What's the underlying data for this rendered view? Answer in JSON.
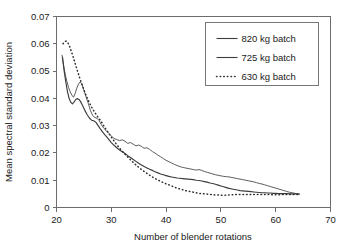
{
  "chart_data": {
    "type": "line",
    "title": "",
    "xlabel": "Number of blender rotations",
    "ylabel": "Mean spectral standard deviation",
    "xlim": [
      20,
      70
    ],
    "ylim": [
      0,
      0.07
    ],
    "xticks": [
      20,
      30,
      40,
      50,
      60,
      70
    ],
    "xtick_labels": [
      "20",
      "30",
      "40",
      "50",
      "60",
      "70"
    ],
    "yticks": [
      0,
      0.01,
      0.02,
      0.03,
      0.04,
      0.05,
      0.06,
      0.07
    ],
    "ytick_labels": [
      "0",
      "0.01",
      "0.02",
      "0.03",
      "0.04",
      "0.05",
      "0.06",
      "0.07"
    ],
    "grid": false,
    "legend_position": "upper right",
    "series": [
      {
        "name": "820 kg batch",
        "style": "solid",
        "color": "#4a4a4a",
        "points": [
          [
            21.0,
            0.0558
          ],
          [
            21.3,
            0.052
          ],
          [
            21.6,
            0.0487
          ],
          [
            21.9,
            0.0462
          ],
          [
            22.2,
            0.044
          ],
          [
            22.5,
            0.0424
          ],
          [
            22.8,
            0.0412
          ],
          [
            23.1,
            0.0404
          ],
          [
            23.4,
            0.0418
          ],
          [
            23.7,
            0.0437
          ],
          [
            24.0,
            0.0452
          ],
          [
            24.3,
            0.046
          ],
          [
            24.6,
            0.0455
          ],
          [
            25.0,
            0.043
          ],
          [
            25.4,
            0.0405
          ],
          [
            25.8,
            0.0382
          ],
          [
            26.2,
            0.0355
          ],
          [
            26.6,
            0.0337
          ],
          [
            27.0,
            0.033
          ],
          [
            27.4,
            0.0327
          ],
          [
            27.8,
            0.0318
          ],
          [
            28.2,
            0.0303
          ],
          [
            28.6,
            0.0291
          ],
          [
            29.0,
            0.0283
          ],
          [
            29.5,
            0.0272
          ],
          [
            30.0,
            0.0262
          ],
          [
            30.5,
            0.0253
          ],
          [
            31.0,
            0.0249
          ],
          [
            31.5,
            0.0245
          ],
          [
            32.0,
            0.0248
          ],
          [
            32.5,
            0.0243
          ],
          [
            33.0,
            0.0235
          ],
          [
            33.5,
            0.0238
          ],
          [
            34.0,
            0.0232
          ],
          [
            34.5,
            0.0226
          ],
          [
            35.0,
            0.0229
          ],
          [
            35.5,
            0.0224
          ],
          [
            36.0,
            0.0217
          ],
          [
            36.5,
            0.0219
          ],
          [
            37.0,
            0.0213
          ],
          [
            37.5,
            0.0205
          ],
          [
            38.0,
            0.0199
          ],
          [
            38.5,
            0.0192
          ],
          [
            39.0,
            0.0186
          ],
          [
            39.5,
            0.0179
          ],
          [
            40.0,
            0.0173
          ],
          [
            40.5,
            0.0168
          ],
          [
            41.0,
            0.0163
          ],
          [
            41.5,
            0.0158
          ],
          [
            42.0,
            0.0154
          ],
          [
            42.5,
            0.015
          ],
          [
            43.0,
            0.0147
          ],
          [
            43.5,
            0.0145
          ],
          [
            44.0,
            0.0143
          ],
          [
            44.5,
            0.0141
          ],
          [
            45.0,
            0.0139
          ],
          [
            45.5,
            0.0137
          ],
          [
            46.0,
            0.0139
          ],
          [
            46.5,
            0.0136
          ],
          [
            47.0,
            0.0132
          ],
          [
            47.5,
            0.0129
          ],
          [
            48.0,
            0.0126
          ],
          [
            48.5,
            0.0123
          ],
          [
            49.0,
            0.012
          ],
          [
            49.5,
            0.0118
          ],
          [
            50.0,
            0.0116
          ],
          [
            50.5,
            0.0114
          ],
          [
            51.0,
            0.0113
          ],
          [
            51.5,
            0.0112
          ],
          [
            52.0,
            0.011
          ],
          [
            52.5,
            0.0108
          ],
          [
            53.0,
            0.0106
          ],
          [
            53.5,
            0.0104
          ],
          [
            54.0,
            0.0102
          ],
          [
            54.5,
            0.01
          ],
          [
            55.0,
            0.0098
          ],
          [
            55.5,
            0.0096
          ],
          [
            56.0,
            0.0094
          ],
          [
            56.5,
            0.0091
          ],
          [
            57.0,
            0.0088
          ],
          [
            57.5,
            0.0086
          ],
          [
            58.0,
            0.0083
          ],
          [
            58.5,
            0.008
          ],
          [
            59.0,
            0.0077
          ],
          [
            59.5,
            0.0074
          ],
          [
            60.0,
            0.0071
          ],
          [
            60.5,
            0.0068
          ],
          [
            61.0,
            0.0065
          ],
          [
            61.5,
            0.0062
          ],
          [
            62.0,
            0.0059
          ],
          [
            62.5,
            0.0056
          ],
          [
            63.0,
            0.0054
          ],
          [
            63.5,
            0.0052
          ],
          [
            64.0,
            0.005
          ],
          [
            64.3,
            0.0049
          ]
        ]
      },
      {
        "name": "725 kg batch",
        "style": "solid",
        "color": "#3c3c3c",
        "points": [
          [
            21.1,
            0.055
          ],
          [
            21.4,
            0.05
          ],
          [
            21.7,
            0.046
          ],
          [
            22.0,
            0.0425
          ],
          [
            22.3,
            0.04
          ],
          [
            22.6,
            0.0386
          ],
          [
            22.9,
            0.038
          ],
          [
            23.2,
            0.0386
          ],
          [
            23.5,
            0.0396
          ],
          [
            23.8,
            0.0399
          ],
          [
            24.1,
            0.0396
          ],
          [
            24.4,
            0.0388
          ],
          [
            24.8,
            0.0372
          ],
          [
            25.2,
            0.0355
          ],
          [
            25.6,
            0.034
          ],
          [
            26.0,
            0.0328
          ],
          [
            26.4,
            0.032
          ],
          [
            26.8,
            0.0318
          ],
          [
            27.2,
            0.0312
          ],
          [
            27.6,
            0.03
          ],
          [
            28.0,
            0.0288
          ],
          [
            28.4,
            0.0277
          ],
          [
            28.8,
            0.0267
          ],
          [
            29.2,
            0.0258
          ],
          [
            29.6,
            0.0248
          ],
          [
            30.0,
            0.0238
          ],
          [
            30.5,
            0.0228
          ],
          [
            31.0,
            0.0219
          ],
          [
            31.5,
            0.0211
          ],
          [
            32.0,
            0.0204
          ],
          [
            32.5,
            0.0198
          ],
          [
            33.0,
            0.019
          ],
          [
            33.5,
            0.0183
          ],
          [
            34.0,
            0.0176
          ],
          [
            34.5,
            0.0169
          ],
          [
            35.0,
            0.0162
          ],
          [
            35.5,
            0.0156
          ],
          [
            36.0,
            0.015
          ],
          [
            36.5,
            0.0145
          ],
          [
            37.0,
            0.014
          ],
          [
            37.5,
            0.0136
          ],
          [
            38.0,
            0.0131
          ],
          [
            38.5,
            0.0127
          ],
          [
            39.0,
            0.0123
          ],
          [
            39.5,
            0.012
          ],
          [
            40.0,
            0.0117
          ],
          [
            40.5,
            0.0114
          ],
          [
            41.0,
            0.0112
          ],
          [
            41.5,
            0.011
          ],
          [
            42.0,
            0.0108
          ],
          [
            42.5,
            0.0107
          ],
          [
            43.0,
            0.0106
          ],
          [
            43.5,
            0.0105
          ],
          [
            44.0,
            0.0104
          ],
          [
            44.5,
            0.0103
          ],
          [
            45.0,
            0.0102
          ],
          [
            45.5,
            0.01
          ],
          [
            46.0,
            0.0099
          ],
          [
            46.5,
            0.0097
          ],
          [
            47.0,
            0.0095
          ],
          [
            47.5,
            0.0093
          ],
          [
            48.0,
            0.009
          ],
          [
            48.5,
            0.0088
          ],
          [
            49.0,
            0.0085
          ],
          [
            49.5,
            0.0082
          ],
          [
            50.0,
            0.0079
          ],
          [
            50.5,
            0.0076
          ],
          [
            51.0,
            0.0073
          ],
          [
            51.5,
            0.007
          ],
          [
            52.0,
            0.0068
          ],
          [
            52.5,
            0.0066
          ],
          [
            53.0,
            0.0064
          ],
          [
            53.5,
            0.0062
          ],
          [
            54.0,
            0.0061
          ],
          [
            54.5,
            0.006
          ],
          [
            55.0,
            0.0059
          ],
          [
            55.5,
            0.0058
          ],
          [
            56.0,
            0.0057
          ],
          [
            56.5,
            0.0056
          ],
          [
            57.0,
            0.0055
          ],
          [
            57.5,
            0.0054
          ],
          [
            58.0,
            0.0054
          ],
          [
            58.5,
            0.0053
          ],
          [
            59.0,
            0.0053
          ],
          [
            59.5,
            0.0052
          ],
          [
            60.0,
            0.0052
          ],
          [
            60.5,
            0.0051
          ],
          [
            61.0,
            0.0051
          ],
          [
            61.5,
            0.0051
          ],
          [
            62.0,
            0.0051
          ],
          [
            62.5,
            0.005
          ],
          [
            63.0,
            0.005
          ],
          [
            63.5,
            0.005
          ],
          [
            64.0,
            0.005
          ],
          [
            64.3,
            0.0049
          ]
        ]
      },
      {
        "name": "630 kg batch",
        "style": "dotted",
        "color": "#2e2e2e",
        "points": [
          [
            21.2,
            0.06
          ],
          [
            21.5,
            0.0608
          ],
          [
            21.8,
            0.061
          ],
          [
            22.1,
            0.0603
          ],
          [
            22.4,
            0.059
          ],
          [
            22.7,
            0.0573
          ],
          [
            23.0,
            0.0555
          ],
          [
            23.3,
            0.0535
          ],
          [
            23.6,
            0.0515
          ],
          [
            23.9,
            0.0496
          ],
          [
            24.2,
            0.0477
          ],
          [
            24.5,
            0.0459
          ],
          [
            24.8,
            0.0442
          ],
          [
            25.1,
            0.0426
          ],
          [
            25.4,
            0.0411
          ],
          [
            25.7,
            0.0397
          ],
          [
            26.0,
            0.0384
          ],
          [
            26.3,
            0.0372
          ],
          [
            26.6,
            0.0361
          ],
          [
            26.9,
            0.0351
          ],
          [
            27.2,
            0.0342
          ],
          [
            27.5,
            0.0333
          ],
          [
            27.8,
            0.0325
          ],
          [
            28.1,
            0.0317
          ],
          [
            28.4,
            0.0307
          ],
          [
            28.7,
            0.0297
          ],
          [
            29.0,
            0.0287
          ],
          [
            29.4,
            0.0276
          ],
          [
            29.8,
            0.0264
          ],
          [
            30.2,
            0.0252
          ],
          [
            30.6,
            0.0241
          ],
          [
            31.0,
            0.023
          ],
          [
            31.4,
            0.022
          ],
          [
            31.8,
            0.0211
          ],
          [
            32.2,
            0.0202
          ],
          [
            32.6,
            0.0193
          ],
          [
            33.0,
            0.0185
          ],
          [
            33.5,
            0.0175
          ],
          [
            34.0,
            0.0165
          ],
          [
            34.5,
            0.0156
          ],
          [
            35.0,
            0.0147
          ],
          [
            35.5,
            0.0139
          ],
          [
            36.0,
            0.0132
          ],
          [
            36.5,
            0.0125
          ],
          [
            37.0,
            0.0118
          ],
          [
            37.5,
            0.0112
          ],
          [
            38.0,
            0.0106
          ],
          [
            38.5,
            0.0101
          ],
          [
            39.0,
            0.0096
          ],
          [
            39.5,
            0.0091
          ],
          [
            40.0,
            0.0087
          ],
          [
            40.5,
            0.0083
          ],
          [
            41.0,
            0.0079
          ],
          [
            41.5,
            0.0075
          ],
          [
            42.0,
            0.0071
          ],
          [
            42.5,
            0.0068
          ],
          [
            43.0,
            0.0065
          ],
          [
            43.5,
            0.0062
          ],
          [
            44.0,
            0.006
          ],
          [
            44.5,
            0.0058
          ],
          [
            45.0,
            0.0056
          ],
          [
            45.5,
            0.0054
          ],
          [
            46.0,
            0.0052
          ],
          [
            46.5,
            0.0051
          ],
          [
            47.0,
            0.005
          ],
          [
            47.5,
            0.0049
          ],
          [
            48.0,
            0.0048
          ],
          [
            48.5,
            0.0047
          ],
          [
            49.0,
            0.0046
          ],
          [
            49.5,
            0.0046
          ],
          [
            50.0,
            0.0045
          ],
          [
            50.5,
            0.0045
          ],
          [
            51.0,
            0.0045
          ],
          [
            51.5,
            0.0046
          ],
          [
            52.0,
            0.0047
          ],
          [
            52.5,
            0.0047
          ],
          [
            53.0,
            0.0048
          ],
          [
            53.5,
            0.0048
          ],
          [
            54.0,
            0.0048
          ],
          [
            54.5,
            0.0048
          ],
          [
            55.0,
            0.0048
          ],
          [
            55.5,
            0.0048
          ],
          [
            56.0,
            0.0048
          ],
          [
            56.5,
            0.0048
          ],
          [
            57.0,
            0.0048
          ],
          [
            57.5,
            0.0048
          ],
          [
            58.0,
            0.0048
          ],
          [
            58.5,
            0.0048
          ],
          [
            59.0,
            0.0047
          ],
          [
            59.5,
            0.0047
          ],
          [
            60.0,
            0.0047
          ],
          [
            60.5,
            0.0047
          ],
          [
            61.0,
            0.0047
          ],
          [
            61.5,
            0.0048
          ],
          [
            62.0,
            0.0048
          ],
          [
            62.5,
            0.0048
          ],
          [
            63.0,
            0.0048
          ],
          [
            63.5,
            0.0048
          ],
          [
            64.0,
            0.0048
          ]
        ]
      }
    ],
    "legend_entries": [
      {
        "label": "820 kg batch",
        "style": "solid"
      },
      {
        "label": "725 kg batch",
        "style": "solid"
      },
      {
        "label": "630 kg batch",
        "style": "dotted"
      }
    ]
  }
}
